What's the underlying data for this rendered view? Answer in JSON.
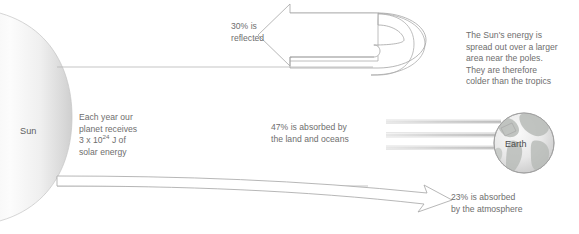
{
  "figure": {
    "background_color": "#ffffff",
    "text_color": "#6e6e6e",
    "stroke_color": "#9a9a9a"
  },
  "bodies": {
    "sun": {
      "label": "Sun",
      "shape": "partial-ellipse",
      "fill_light": "#fdfdfd",
      "fill_dark": "#d6d6d6"
    },
    "earth": {
      "label": "Earth",
      "shape": "globe",
      "fill_light": "#f2f2f2",
      "fill_dark": "#c9c9c9",
      "continent_color": "#b9bdb9"
    }
  },
  "annotations": {
    "solar_energy": {
      "line1": "Each year our",
      "line2": "planet receives",
      "value_base": "3 x 10",
      "value_exponent": "24",
      "value_unit": " J of",
      "line4": "solar energy"
    },
    "reflected": {
      "percent": "30%",
      "text": "30% is\nreflected"
    },
    "absorbed_land": {
      "percent": "47%",
      "text": "47% is absorbed by\nthe land and oceans"
    },
    "absorbed_atmosphere": {
      "percent": "23%",
      "text": "23% is absorbed\nby the atmosphere"
    },
    "poles": {
      "text": "The Sun's energy is\nspread out over a larger\narea near the poles.\nThey are therefore\ncolder than the tropics"
    }
  },
  "flows": [
    {
      "name": "incoming-solar-beam",
      "from": "sun",
      "to": "earth"
    },
    {
      "name": "reflected-arrow",
      "percent": "30%",
      "direction": "left-curved"
    },
    {
      "name": "absorbed-land-rays",
      "percent": "47%",
      "direction": "right"
    },
    {
      "name": "absorbed-atmosphere-arrow",
      "percent": "23%",
      "direction": "right-down"
    }
  ]
}
